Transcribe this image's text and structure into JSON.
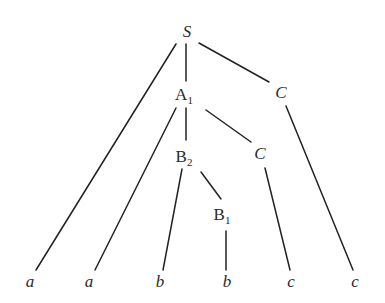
{
  "diagram": {
    "type": "parse-tree",
    "nodes": [
      {
        "id": "S",
        "label": "S",
        "sub": "",
        "italic": true,
        "x": 187,
        "y": 37
      },
      {
        "id": "A1",
        "label": "A",
        "sub": "1",
        "italic": false,
        "x": 184,
        "y": 100
      },
      {
        "id": "C_top",
        "label": "C",
        "sub": "",
        "italic": true,
        "x": 281,
        "y": 98
      },
      {
        "id": "B2",
        "label": "B",
        "sub": "2",
        "italic": false,
        "x": 184,
        "y": 162
      },
      {
        "id": "C_mid",
        "label": "C",
        "sub": "",
        "italic": true,
        "x": 260,
        "y": 159
      },
      {
        "id": "B1",
        "label": "B",
        "sub": "1",
        "italic": false,
        "x": 222,
        "y": 220
      },
      {
        "id": "a1",
        "label": "a",
        "sub": "",
        "italic": true,
        "x": 30,
        "y": 287
      },
      {
        "id": "a2",
        "label": "a",
        "sub": "",
        "italic": true,
        "x": 89,
        "y": 287
      },
      {
        "id": "b1",
        "label": "b",
        "sub": "",
        "italic": true,
        "x": 160,
        "y": 287
      },
      {
        "id": "b2",
        "label": "b",
        "sub": "",
        "italic": true,
        "x": 227,
        "y": 287
      },
      {
        "id": "c1",
        "label": "c",
        "sub": "",
        "italic": true,
        "x": 291,
        "y": 287
      },
      {
        "id": "c2",
        "label": "c",
        "sub": "",
        "italic": true,
        "x": 355,
        "y": 287
      }
    ],
    "edges": [
      {
        "from": "S",
        "to": "a1",
        "x1": 176,
        "y1": 44,
        "x2": 36,
        "y2": 270
      },
      {
        "from": "S",
        "to": "A1",
        "x1": 186,
        "y1": 44,
        "x2": 186,
        "y2": 81
      },
      {
        "from": "S",
        "to": "C_top",
        "x1": 199,
        "y1": 43,
        "x2": 269,
        "y2": 82
      },
      {
        "from": "A1",
        "to": "a2",
        "x1": 176,
        "y1": 108,
        "x2": 95,
        "y2": 270
      },
      {
        "from": "A1",
        "to": "B2",
        "x1": 186,
        "y1": 108,
        "x2": 186,
        "y2": 140
      },
      {
        "from": "A1",
        "to": "C_mid",
        "x1": 206,
        "y1": 110,
        "x2": 251,
        "y2": 142
      },
      {
        "from": "C_top",
        "to": "c2",
        "x1": 286,
        "y1": 106,
        "x2": 353,
        "y2": 270
      },
      {
        "from": "B2",
        "to": "b1",
        "x1": 182,
        "y1": 169,
        "x2": 163,
        "y2": 270
      },
      {
        "from": "B2",
        "to": "B1",
        "x1": 201,
        "y1": 172,
        "x2": 221,
        "y2": 199
      },
      {
        "from": "B1",
        "to": "b2",
        "x1": 226,
        "y1": 231,
        "x2": 226,
        "y2": 270
      },
      {
        "from": "C_mid",
        "to": "c1",
        "x1": 265,
        "y1": 168,
        "x2": 290,
        "y2": 270
      }
    ],
    "leaves": [
      "a",
      "a",
      "b",
      "b",
      "c",
      "c"
    ],
    "colors": {
      "line": "#222222",
      "text": "#2a2a2a",
      "background": "#ffffff"
    }
  }
}
